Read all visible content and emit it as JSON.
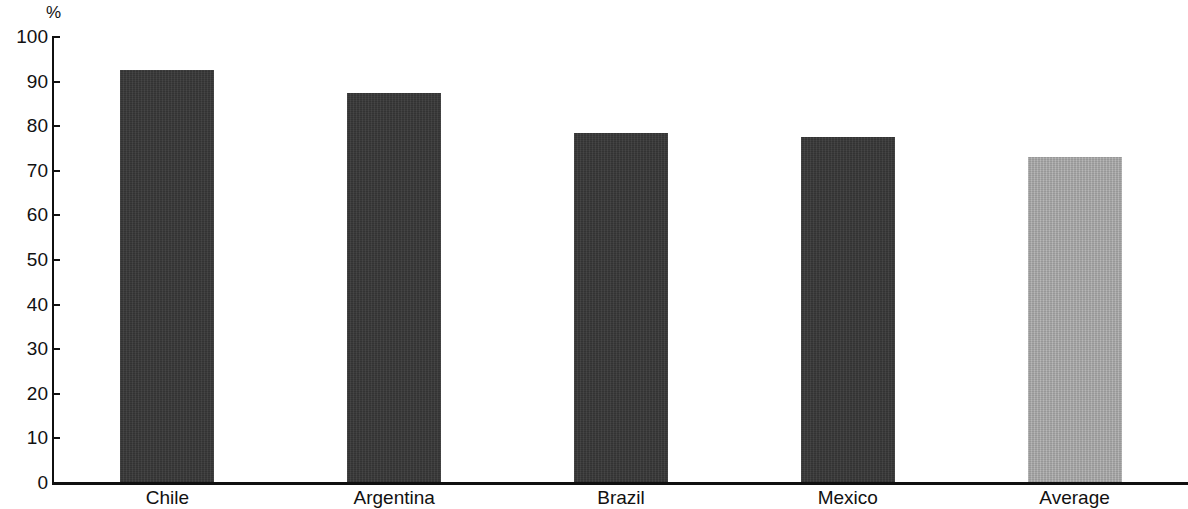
{
  "chart_data": {
    "type": "bar",
    "title": "",
    "subtitle": "",
    "xlabel": "",
    "ylabel": "%",
    "unit_label": "%",
    "categories": [
      "Chile",
      "Argentina",
      "Brazil",
      "Mexico",
      "Average"
    ],
    "values": [
      92.5,
      87.5,
      78.5,
      77.5,
      73.0
    ],
    "series": [
      {
        "name": "",
        "values": [
          92.5,
          87.5,
          78.5,
          77.5,
          73.0
        ]
      }
    ],
    "ylim": [
      0,
      100
    ],
    "ytick_labels": [
      "100",
      "90",
      "80",
      "70",
      "60",
      "50",
      "40",
      "30",
      "20",
      "10",
      "0"
    ],
    "ytick_values": [
      100,
      90,
      80,
      70,
      60,
      50,
      40,
      30,
      20,
      10,
      0
    ],
    "grid": false,
    "legend": null,
    "legend_position": "none",
    "bar_colors": [
      "#383838",
      "#383838",
      "#383838",
      "#383838",
      "#a9a9a9"
    ],
    "highlight_color": "#a9a9a9",
    "primary_color": "#383838",
    "axis_color": "#101010",
    "background_color": "#ffffff"
  }
}
